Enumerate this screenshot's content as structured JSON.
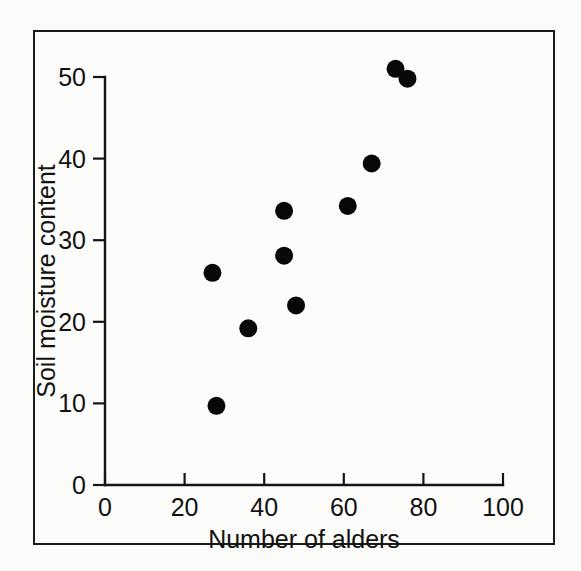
{
  "figure": {
    "background_color": "#fbfbf9",
    "frame_color": "#1b1b1b",
    "ink_color": "#121212"
  },
  "chart_data": {
    "type": "scatter",
    "title": "",
    "xlabel": "Number of alders",
    "ylabel": "Soil moisture content",
    "xlim": [
      0,
      100
    ],
    "ylim": [
      0,
      50
    ],
    "xticks": [
      0,
      20,
      40,
      60,
      80,
      100
    ],
    "yticks": [
      0,
      10,
      20,
      30,
      40,
      50
    ],
    "xtick_labels": [
      "0",
      "20",
      "40",
      "60",
      "80",
      "100"
    ],
    "ytick_labels": [
      "0",
      "10",
      "20",
      "30",
      "40",
      "50"
    ],
    "grid": false,
    "legend": false,
    "marker": "filled-circle",
    "marker_color": "#080808",
    "marker_size_px": 9,
    "points": [
      {
        "x": 28,
        "y": 9.7
      },
      {
        "x": 27,
        "y": 26.0
      },
      {
        "x": 36,
        "y": 19.2
      },
      {
        "x": 45,
        "y": 33.6
      },
      {
        "x": 45,
        "y": 28.1
      },
      {
        "x": 48,
        "y": 22.0
      },
      {
        "x": 61,
        "y": 34.2
      },
      {
        "x": 67,
        "y": 39.4
      },
      {
        "x": 73,
        "y": 51.0
      },
      {
        "x": 76,
        "y": 49.8
      }
    ],
    "series": [
      {
        "name": "Soil moisture vs alders",
        "x": [
          28,
          27,
          36,
          45,
          45,
          48,
          61,
          67,
          73,
          76
        ],
        "values": [
          9.7,
          26.0,
          19.2,
          33.6,
          28.1,
          22.0,
          34.2,
          39.4,
          51.0,
          49.8
        ]
      }
    ]
  }
}
